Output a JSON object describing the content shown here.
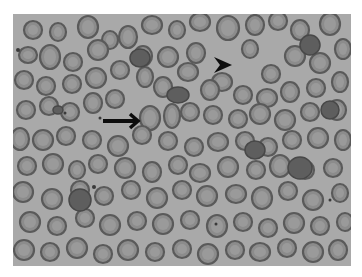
{
  "figure": {
    "alt": "Peripheral blood smear micrograph showing red blood cells with an arrow and an arrowhead marking specific cells",
    "background_color": "#ffffff",
    "field_color": "#a9a9a9",
    "cell_rim_color": "#5a5a5a",
    "cell_fill_color": "#8c8c8c",
    "cell_center_color": "#9e9e9e",
    "annotation_color": "#0d0d0d"
  },
  "annotations": {
    "arrow": {
      "label": "arrow",
      "x1": 103,
      "y1": 121,
      "x2": 138,
      "y2": 121
    },
    "arrowhead": {
      "label": "arrowhead",
      "tip_x": 232,
      "tip_y": 65
    }
  },
  "cells": [
    [
      33,
      30,
      9,
      9
    ],
    [
      58,
      32,
      8,
      9
    ],
    [
      88,
      27,
      10,
      11
    ],
    [
      110,
      40,
      8,
      9
    ],
    [
      128,
      37,
      9,
      11
    ],
    [
      152,
      25,
      10,
      9
    ],
    [
      177,
      30,
      8,
      9
    ],
    [
      200,
      22,
      10,
      9
    ],
    [
      228,
      28,
      11,
      12
    ],
    [
      255,
      25,
      9,
      10
    ],
    [
      278,
      21,
      9,
      9
    ],
    [
      300,
      30,
      9,
      10
    ],
    [
      330,
      24,
      10,
      11
    ],
    [
      28,
      55,
      9,
      8
    ],
    [
      50,
      57,
      10,
      12
    ],
    [
      73,
      62,
      9,
      9
    ],
    [
      98,
      50,
      10,
      10
    ],
    [
      120,
      70,
      9,
      9
    ],
    [
      143,
      56,
      9,
      10
    ],
    [
      168,
      57,
      10,
      10
    ],
    [
      196,
      53,
      9,
      10
    ],
    [
      222,
      82,
      10,
      9
    ],
    [
      250,
      49,
      8,
      9
    ],
    [
      271,
      74,
      9,
      9
    ],
    [
      295,
      56,
      10,
      10
    ],
    [
      320,
      63,
      10,
      10
    ],
    [
      343,
      49,
      8,
      10
    ],
    [
      24,
      80,
      9,
      9
    ],
    [
      46,
      86,
      9,
      9
    ],
    [
      72,
      84,
      9,
      9
    ],
    [
      96,
      78,
      10,
      10
    ],
    [
      115,
      99,
      9,
      9
    ],
    [
      145,
      77,
      8,
      10
    ],
    [
      163,
      87,
      9,
      10
    ],
    [
      188,
      72,
      10,
      9
    ],
    [
      210,
      90,
      9,
      10
    ],
    [
      243,
      95,
      9,
      9
    ],
    [
      267,
      98,
      10,
      9
    ],
    [
      290,
      92,
      9,
      10
    ],
    [
      316,
      88,
      9,
      9
    ],
    [
      340,
      82,
      8,
      10
    ],
    [
      26,
      110,
      9,
      9
    ],
    [
      49,
      106,
      9,
      9
    ],
    [
      70,
      112,
      9,
      9
    ],
    [
      93,
      103,
      9,
      10
    ],
    [
      150,
      118,
      10,
      12
    ],
    [
      172,
      116,
      8,
      12
    ],
    [
      190,
      112,
      9,
      9
    ],
    [
      213,
      115,
      9,
      9
    ],
    [
      238,
      119,
      9,
      9
    ],
    [
      260,
      114,
      10,
      10
    ],
    [
      285,
      120,
      10,
      10
    ],
    [
      310,
      112,
      9,
      9
    ],
    [
      337,
      110,
      9,
      10
    ],
    [
      20,
      139,
      9,
      11
    ],
    [
      43,
      140,
      10,
      10
    ],
    [
      66,
      136,
      9,
      9
    ],
    [
      92,
      140,
      9,
      9
    ],
    [
      118,
      146,
      10,
      10
    ],
    [
      142,
      135,
      9,
      9
    ],
    [
      168,
      141,
      9,
      9
    ],
    [
      194,
      147,
      9,
      9
    ],
    [
      218,
      142,
      10,
      9
    ],
    [
      245,
      141,
      9,
      9
    ],
    [
      268,
      147,
      9,
      9
    ],
    [
      292,
      140,
      9,
      9
    ],
    [
      318,
      138,
      10,
      10
    ],
    [
      343,
      140,
      8,
      10
    ],
    [
      27,
      166,
      9,
      9
    ],
    [
      53,
      164,
      10,
      10
    ],
    [
      77,
      170,
      8,
      9
    ],
    [
      98,
      164,
      9,
      9
    ],
    [
      125,
      168,
      10,
      10
    ],
    [
      152,
      172,
      9,
      10
    ],
    [
      178,
      165,
      9,
      9
    ],
    [
      200,
      173,
      10,
      9
    ],
    [
      228,
      167,
      10,
      10
    ],
    [
      256,
      170,
      9,
      9
    ],
    [
      280,
      166,
      10,
      11
    ],
    [
      305,
      170,
      9,
      9
    ],
    [
      333,
      168,
      9,
      9
    ],
    [
      23,
      192,
      10,
      10
    ],
    [
      52,
      199,
      10,
      10
    ],
    [
      80,
      190,
      9,
      9
    ],
    [
      104,
      196,
      9,
      9
    ],
    [
      131,
      190,
      9,
      9
    ],
    [
      157,
      198,
      10,
      10
    ],
    [
      182,
      190,
      9,
      9
    ],
    [
      207,
      196,
      10,
      10
    ],
    [
      236,
      194,
      10,
      9
    ],
    [
      262,
      198,
      10,
      11
    ],
    [
      288,
      191,
      9,
      9
    ],
    [
      313,
      200,
      10,
      10
    ],
    [
      340,
      193,
      8,
      9
    ],
    [
      30,
      222,
      10,
      10
    ],
    [
      57,
      226,
      9,
      9
    ],
    [
      85,
      218,
      9,
      9
    ],
    [
      110,
      225,
      10,
      10
    ],
    [
      137,
      221,
      9,
      9
    ],
    [
      163,
      224,
      10,
      10
    ],
    [
      190,
      220,
      9,
      9
    ],
    [
      217,
      226,
      10,
      11
    ],
    [
      243,
      222,
      9,
      9
    ],
    [
      268,
      228,
      9,
      9
    ],
    [
      294,
      223,
      10,
      10
    ],
    [
      320,
      226,
      9,
      9
    ],
    [
      345,
      222,
      8,
      9
    ],
    [
      24,
      250,
      10,
      10
    ],
    [
      50,
      252,
      9,
      9
    ],
    [
      77,
      248,
      10,
      10
    ],
    [
      103,
      254,
      9,
      9
    ],
    [
      128,
      250,
      10,
      10
    ],
    [
      155,
      252,
      9,
      9
    ],
    [
      182,
      249,
      9,
      9
    ],
    [
      208,
      254,
      10,
      10
    ],
    [
      235,
      250,
      9,
      9
    ],
    [
      260,
      252,
      10,
      9
    ],
    [
      287,
      248,
      9,
      9
    ],
    [
      313,
      252,
      10,
      10
    ],
    [
      338,
      250,
      9,
      10
    ]
  ],
  "dark_cells": [
    [
      58,
      110,
      5,
      4
    ],
    [
      178,
      95,
      11,
      8
    ],
    [
      140,
      58,
      10,
      9
    ],
    [
      310,
      45,
      10,
      10
    ],
    [
      80,
      200,
      11,
      11
    ],
    [
      300,
      168,
      12,
      11
    ],
    [
      255,
      150,
      10,
      9
    ],
    [
      330,
      110,
      9,
      9
    ]
  ],
  "small_dots": [
    [
      18,
      50,
      2
    ],
    [
      100,
      118,
      1.5
    ],
    [
      94,
      187,
      2
    ],
    [
      216,
      224,
      1.5
    ],
    [
      330,
      200,
      1.5
    ],
    [
      65,
      113,
      1.5
    ]
  ]
}
